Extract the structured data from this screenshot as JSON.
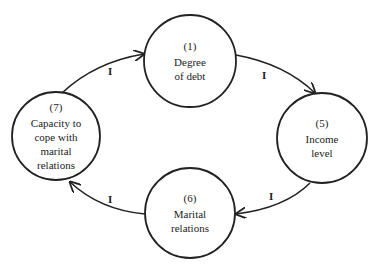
{
  "diagram": {
    "type": "causal-loop",
    "colors": {
      "stroke": "#222222",
      "background": "#ffffff",
      "text": "#222222"
    },
    "nodes": [
      {
        "id": "n1",
        "number": "(1)",
        "label_lines": [
          "Degree",
          "of debt"
        ],
        "cx": 190,
        "cy": 61,
        "r": 46
      },
      {
        "id": "n5",
        "number": "(5)",
        "label_lines": [
          "Income",
          "level"
        ],
        "cx": 322,
        "cy": 138,
        "r": 45
      },
      {
        "id": "n6",
        "number": "(6)",
        "label_lines": [
          "Marital",
          "relations"
        ],
        "cx": 190,
        "cy": 213,
        "r": 45
      },
      {
        "id": "n7",
        "number": "(7)",
        "label_lines": [
          "Capacity to",
          "cope with",
          "marital",
          "relations"
        ],
        "cx": 56,
        "cy": 136,
        "r": 44
      }
    ],
    "edges": [
      {
        "from": "n7",
        "to": "n1",
        "label": "I"
      },
      {
        "from": "n1",
        "to": "n5",
        "label": "I"
      },
      {
        "from": "n5",
        "to": "n6",
        "label": "I"
      },
      {
        "from": "n6",
        "to": "n7",
        "label": "I"
      }
    ]
  }
}
